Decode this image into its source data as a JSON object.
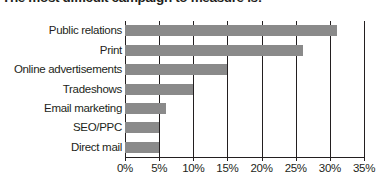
{
  "chart_data": {
    "type": "bar",
    "orientation": "horizontal",
    "title": "The most difficult campaign to measure is:",
    "xlabel": "",
    "ylabel": "",
    "categories": [
      "Public relations",
      "Print",
      "Online advertisements",
      "Tradeshows",
      "Email marketing",
      "SEO/PPC",
      "Direct mail"
    ],
    "values": [
      31,
      26,
      15,
      10,
      6,
      5,
      5
    ],
    "value_suffix": "%",
    "xlim": [
      0,
      35
    ],
    "xticks": [
      0,
      5,
      10,
      15,
      20,
      25,
      30,
      35
    ],
    "xtick_labels": [
      "0%",
      "5%",
      "10%",
      "15%",
      "20%",
      "25%",
      "30%",
      "35%"
    ],
    "grid": true,
    "grid_axis": "x",
    "legend": false,
    "bar_color": "#8a8a8a",
    "axis_color": "#231f20",
    "background_color": "#ffffff"
  }
}
